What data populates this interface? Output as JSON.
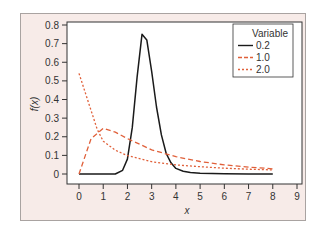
{
  "chart_data": {
    "type": "line",
    "title": "",
    "xlabel": "x",
    "ylabel": "f(x)",
    "xlim": [
      0,
      9
    ],
    "ylim": [
      0,
      0.8
    ],
    "x_ticks": [
      "0",
      "1",
      "2",
      "3",
      "4",
      "5",
      "6",
      "7",
      "8",
      "9"
    ],
    "y_ticks": [
      "0",
      "0.1",
      "0.2",
      "0.3",
      "0.4",
      "0.5",
      "0.6",
      "0.7",
      "0.8"
    ],
    "grid": false,
    "legend": {
      "title": "Variable",
      "position": "top-right"
    },
    "series": [
      {
        "name": "0.2",
        "style": "solid",
        "color": "#1a1a1a",
        "x": [
          0,
          1,
          1.5,
          1.8,
          2.0,
          2.2,
          2.4,
          2.6,
          2.8,
          3.0,
          3.2,
          3.4,
          3.6,
          3.8,
          4.0,
          4.3,
          4.6,
          5.0,
          6.0,
          7.0,
          8.0
        ],
        "y": [
          0,
          0,
          0.0,
          0.02,
          0.08,
          0.25,
          0.52,
          0.75,
          0.72,
          0.55,
          0.36,
          0.21,
          0.11,
          0.06,
          0.03,
          0.015,
          0.008,
          0.004,
          0.001,
          0.0,
          0.0
        ]
      },
      {
        "name": "1.0",
        "style": "dashed",
        "color": "#e0603a",
        "x": [
          0,
          0.5,
          1.0,
          1.5,
          2.0,
          3.0,
          4.0,
          5.0,
          6.0,
          7.0,
          8.0
        ],
        "y": [
          0,
          0.19,
          0.245,
          0.225,
          0.19,
          0.13,
          0.093,
          0.067,
          0.049,
          0.037,
          0.028
        ]
      },
      {
        "name": "2.0",
        "style": "dotted",
        "color": "#e0603a",
        "x": [
          0,
          0.75,
          1.0,
          1.5,
          2.0,
          3.0,
          4.0,
          5.0,
          6.0,
          7.0,
          8.0
        ],
        "y": [
          0.54,
          0.24,
          0.176,
          0.128,
          0.099,
          0.066,
          0.049,
          0.039,
          0.031,
          0.026,
          0.022
        ]
      }
    ]
  },
  "colors": {
    "frame_bg": "#f7ebe8",
    "plot_bg": "#ffffff",
    "line_dark": "#1a1a1a",
    "line_red": "#e0603a"
  }
}
